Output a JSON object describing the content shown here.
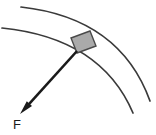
{
  "figure": {
    "background_color": "#ffffff",
    "width": 156,
    "height": 135
  },
  "track": {
    "name": "curved-track",
    "description": "Two concentric circular arcs forming a banked curved path",
    "stroke_color": "#3a3a3a",
    "stroke_width": 1.7,
    "arcs": [
      {
        "name": "outer-arc",
        "start": [
          21,
          7
        ],
        "end": [
          150,
          101
        ],
        "control": [
          120,
          18
        ]
      },
      {
        "name": "inner-arc",
        "start": [
          2,
          28
        ],
        "end": [
          133,
          113
        ],
        "control": [
          101,
          38
        ]
      }
    ]
  },
  "block": {
    "name": "block",
    "label": "",
    "fill_color": "#aaaaaa",
    "stroke_color": "#4a4a4a",
    "center": [
      82,
      45
    ],
    "rotation_deg": -30,
    "width": 26,
    "height": 18,
    "corners": [
      [
        71,
        38
      ],
      [
        90,
        31
      ],
      [
        96,
        46
      ],
      [
        77,
        53
      ]
    ]
  },
  "force_vector": {
    "name": "force-vector",
    "label": "F",
    "color": "#1a1a1a",
    "tail": [
      77,
      51
    ],
    "tip": [
      20,
      114
    ],
    "label_position": [
      13,
      129
    ],
    "stroke_width": 2.6,
    "head_length": 14,
    "head_width": 7
  },
  "labels": {
    "force": "F"
  }
}
